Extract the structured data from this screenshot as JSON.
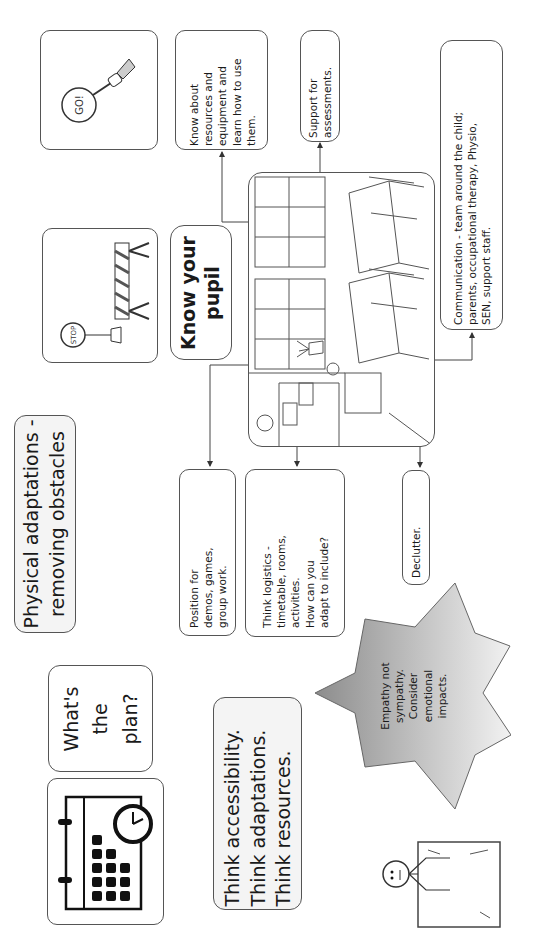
{
  "central": {
    "title": "Know your pupil",
    "illustration": "classroom-illustration"
  },
  "nodes": {
    "go_sign": {
      "icon": "go-sign-icon",
      "label": "GO!"
    },
    "stop_barrier": {
      "icon": "stop-barrier-icon",
      "label": "STOP"
    },
    "know_resources": {
      "text": "Know about\nresources and\nequipment  and\nlearn how to use\nthem."
    },
    "support_assessments": {
      "text": "Support for\nassessments."
    },
    "communication": {
      "text": "Communication - team around the child;\nparents, occupational therapy, Physio,\nSEN, support staff."
    },
    "physical_adaptations": {
      "text": "Physical adaptations -\nremoving obstacles"
    },
    "position": {
      "text": "Position for\ndemos, games,\ngroup work."
    },
    "logistics": {
      "text": "Think logistics -\ntimetable, rooms,\nactivities.\nHow can you\nadapt to include?"
    },
    "declutter": {
      "text": "Declutter."
    },
    "whats_plan": {
      "text": "What's\nthe\nplan?"
    },
    "calendar": {
      "icon": "calendar-clock-icon"
    },
    "think": {
      "text": "Think accessibility.\nThink adaptations.\nThink resources."
    },
    "empathy": {
      "text": "Empathy not\nsympathy.\nConsider\nemotional\nimpacts."
    },
    "stick_figure": {
      "icon": "stick-figure-box-icon"
    }
  },
  "colors": {
    "border": "#555555",
    "star_dark": "#8c8c8c",
    "star_light": "#f2f2f2",
    "text": "#1a1a1a"
  }
}
